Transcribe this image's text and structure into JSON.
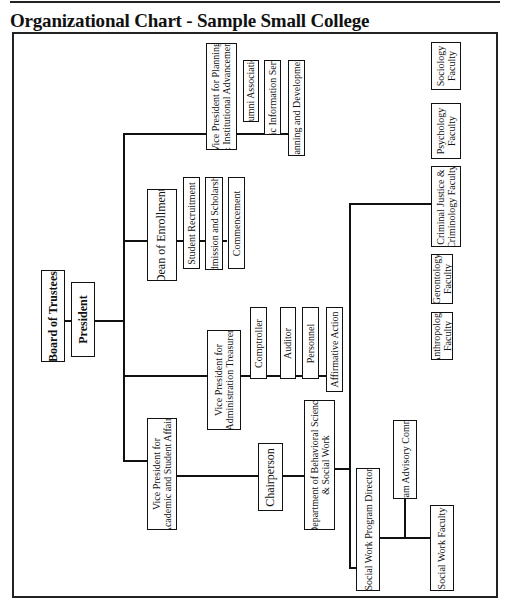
{
  "title": "Organizational Chart - Sample Small College",
  "nodes": {
    "board": "Board of Trustees",
    "president": "President",
    "vp_planning": "Vice President for Planning\n& Institutional Advancement",
    "alumni": "Alumni Association",
    "public_info": "Public Information Services",
    "planning_dev": "Planning and Development",
    "dean_enrollment": "Dean of Enrollment",
    "student_recruitment": "Student Recruitment",
    "admission": "Admission and Scholarship",
    "commencement": "Commencement",
    "vp_admin": "Vice President for\nAdministration Treasurer",
    "controller": "Comptroller",
    "auditor": "Auditor",
    "personnel": "Personnel",
    "affirmative_action": "Affirmative Action",
    "vp_academic": "Vice President for\nAcademic and Student Affairs",
    "chairperson": "Chairperson",
    "department": "Department of Behavioral Science\n& Social Work",
    "anthropology": "Anthropology\nFaculty",
    "gerontology": "Gerontology\nFaculty",
    "criminal_justice": "Criminal Justice &\nCriminology Faculty",
    "psychology": "Psychology\nFaculty",
    "sociology": "Sociology\nFaculty",
    "sw_director": "Social Work Program Director",
    "advisory": "Program Advisory Committee",
    "sw_faculty": "Social Work Faculty"
  },
  "hierarchy": {
    "Board of Trustees": [
      "President"
    ],
    "President": [
      "Vice President for Planning & Institutional Advancement",
      "Dean of Enrollment",
      "Vice President for Administration Treasurer",
      "Vice President for Academic and Student Affairs"
    ],
    "Vice President for Planning & Institutional Advancement": [
      "Alumni Association",
      "Public Information Services",
      "Planning and Development"
    ],
    "Dean of Enrollment": [
      "Student Recruitment",
      "Admission and Scholarship",
      "Commencement"
    ],
    "Vice President for Administration Treasurer": [
      "Comptroller",
      "Auditor",
      "Personnel",
      "Affirmative Action"
    ],
    "Vice President for Academic and Student Affairs": [
      "Chairperson"
    ],
    "Chairperson": [
      "Department of Behavioral Science & Social Work"
    ],
    "Department of Behavioral Science & Social Work": [
      "Anthropology Faculty",
      "Gerontology Faculty",
      "Criminal Justice & Criminology Faculty",
      "Psychology Faculty",
      "Sociology Faculty",
      "Social Work Program Director"
    ],
    "Social Work Program Director": [
      "Program Advisory Committee",
      "Social Work Faculty"
    ]
  }
}
